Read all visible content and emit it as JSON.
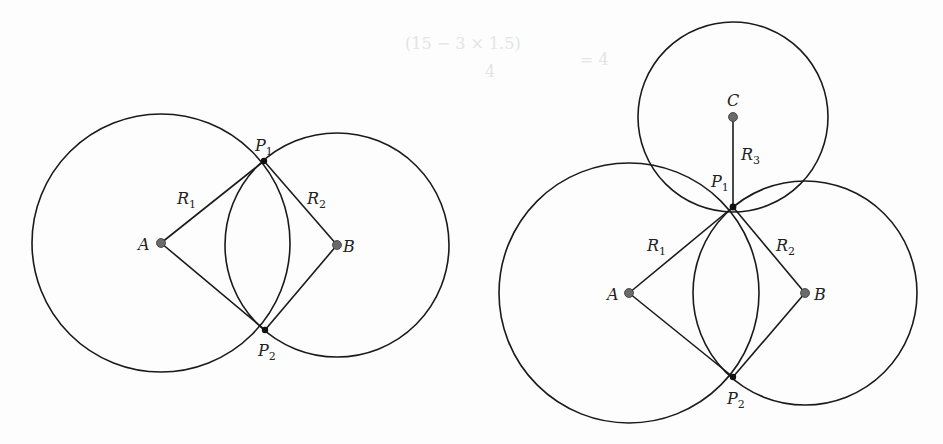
{
  "figure": {
    "left_panel": {
      "title": "Two-circle trilateration",
      "circles": [
        {
          "id": "A",
          "label": "A",
          "cx": 161,
          "cy": 243,
          "r": 129,
          "radius_label": "R",
          "radius_sub": "1"
        },
        {
          "id": "B",
          "label": "B",
          "cx": 337,
          "cy": 245,
          "r": 112,
          "radius_label": "R",
          "radius_sub": "2"
        }
      ],
      "intersections": [
        {
          "id": "P1",
          "label": "P",
          "sub": "1",
          "x": 264,
          "y": 161
        },
        {
          "id": "P2",
          "label": "P",
          "sub": "2",
          "x": 265,
          "y": 330
        }
      ]
    },
    "right_panel": {
      "title": "Three-circle trilateration",
      "circles": [
        {
          "id": "A",
          "label": "A",
          "cx": 629,
          "cy": 293,
          "r": 130,
          "radius_label": "R",
          "radius_sub": "1"
        },
        {
          "id": "B",
          "label": "B",
          "cx": 805,
          "cy": 293,
          "r": 112,
          "radius_label": "R",
          "radius_sub": "2"
        },
        {
          "id": "C",
          "label": "C",
          "cx": 733,
          "cy": 117,
          "r": 95,
          "radius_label": "R",
          "radius_sub": "3"
        }
      ],
      "intersections": [
        {
          "id": "P1",
          "label": "P",
          "sub": "1",
          "x": 733,
          "y": 207
        },
        {
          "id": "P2",
          "label": "P",
          "sub": "2",
          "x": 733,
          "y": 377
        }
      ]
    }
  },
  "labels": {
    "A": "A",
    "B": "B",
    "C": "C",
    "R": "R",
    "P": "P",
    "sub1": "1",
    "sub2": "2",
    "sub3": "3"
  },
  "background_text": {
    "formula": "(15 − 3 × 1.5)",
    "formula_denominator": "4",
    "formula_rhs": "= 4"
  }
}
